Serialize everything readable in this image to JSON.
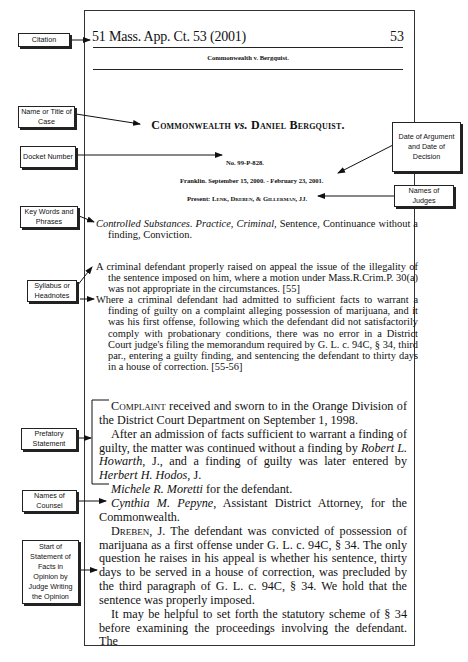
{
  "header": {
    "citation": "51 Mass. App. Ct. 53 (2001)",
    "page_number": "53",
    "running_head": "Commonwealth v. Bergquist."
  },
  "case": {
    "title_part1": "Commonwealth",
    "title_vs": "vs.",
    "title_part2": "Daniel Bergquist.",
    "docket": "No. 99-P-828.",
    "dates": "Franklin. September 15, 2000. - February 23, 2001.",
    "judges_prefix": "Present:",
    "judges": "Lenk, Dreben, & Gillerman, JJ."
  },
  "keywords": {
    "italic": "Controlled Substances. Practice, Criminal,",
    "plain_line1": " Sentence, Continuance without a",
    "plain_line2": "finding, Conviction."
  },
  "headnotes": [
    "A criminal defendant properly raised on appeal the issue of the illegality of the sentence imposed on him, where a motion under Mass.R.Crim.P. 30(a) was not appropriate in the circumstances. [55]",
    "Where a criminal defendant had admitted to sufficient facts to warrant a finding of guilty on a complaint alleging possession of marijuana, and it was his first offense, following which the defendant did not satisfactorily comply with probationary conditions, there was no error in a District Court judge's filing the memorandum required by G. L. c. 94C, § 34, third par., entering a guilty finding, and sentencing the defendant to thirty days in a house of correction. [55-56]"
  ],
  "prefatory": {
    "complaint_lead": "Complaint",
    "complaint_rest": " received and sworn to in the Orange Division of the District Court Department on September 1, 1998.",
    "p2_a": "After an admission of facts sufficient to warrant a finding of guilty, the matter was continued without a finding by ",
    "judge1": "Robert L. Howarth",
    "p2_b": ", J., and a finding of guilty was later entered by ",
    "judge2": "Herbert H. Hodos",
    "p2_c": ", J."
  },
  "counsel": {
    "defense_name": "Michele R. Moretti",
    "defense_role": " for the defendant.",
    "prosecution_name": "Cynthia M. Pepyne",
    "prosecution_role": ", Assistant District Attorney, for the Commonwealth."
  },
  "opinion": {
    "author": "Dreben",
    "p1_rest": ", J. The defendant was convicted of possession of marijuana as a first offense under G. L. c. 94C, § 34. The only question he raises in his appeal is whether his sentence, thirty days to be served in a house of correction, was precluded by the third paragraph of G. L. c. 94C, § 34. We hold that the sentence was properly imposed.",
    "p2": "It may be helpful to set forth the statutory scheme of § 34 before examining the proceedings involving the defendant. The"
  },
  "annotations": {
    "citation": "Citation",
    "case_name": "Name or Title of Case",
    "docket": "Docket Number",
    "dates": "Date of Argument and Date of Decision",
    "judges": "Names of Judges",
    "keywords": "Key Words and Phrases",
    "syllabus": "Syllabus or Headnotes",
    "prefatory": "Prefatory Statement",
    "counsel": "Names of Counsel",
    "facts": "Start of Statement of Facts in Opinion by Judge Writing the Opinion"
  }
}
